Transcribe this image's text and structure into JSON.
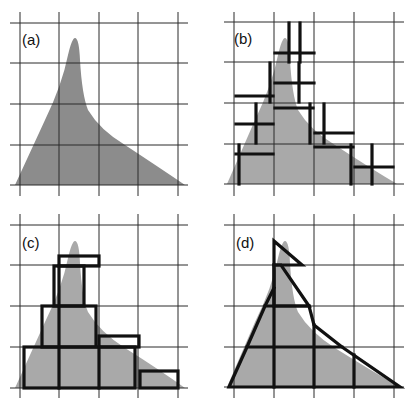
{
  "figure": {
    "panels": [
      {
        "id": "a",
        "label": "(a)",
        "description": "Skewed peaked distribution over grid"
      },
      {
        "id": "b",
        "label": "(b)",
        "description": "Cross markers (discretized samples) over distribution"
      },
      {
        "id": "c",
        "label": "(c)",
        "description": "Rectangular box approximation over distribution"
      },
      {
        "id": "d",
        "label": "(d)",
        "description": "Triangular/polygon mesh approximation over distribution"
      }
    ],
    "grid": {
      "columns": 4,
      "rows": 4
    },
    "colors": {
      "fill": "#a9a9a9",
      "fill_dark": "#8c8c8c",
      "outline": "#111111",
      "grid": "#2a2a2a",
      "background": "#ffffff"
    }
  }
}
